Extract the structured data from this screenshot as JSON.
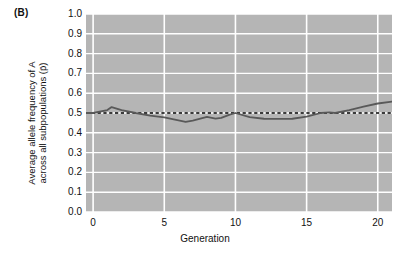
{
  "panel": {
    "label": "(B)"
  },
  "chart_data": {
    "type": "line",
    "title": "",
    "subtitle": "",
    "xlabel": "Generation",
    "ylabel_line1": "Average allele frequency of A",
    "ylabel_line2": "across all subpopulations (p̄)",
    "ylabel_symbol": "p-bar",
    "xlim": [
      -0.5,
      21.0
    ],
    "ylim": [
      0.0,
      1.0
    ],
    "xticks": [
      0,
      5,
      10,
      15,
      20
    ],
    "xtick_labels": [
      "0",
      "5",
      "10",
      "15",
      "20"
    ],
    "yticks": [
      0.0,
      0.1,
      0.2,
      0.3,
      0.4,
      0.5,
      0.6,
      0.7,
      0.8,
      0.9,
      1.0
    ],
    "ytick_labels": [
      "0.0",
      "0.1",
      "0.2",
      "0.3",
      "0.4",
      "0.5",
      "0.6",
      "0.7",
      "0.8",
      "0.9",
      "1.0"
    ],
    "grid": true,
    "grid_color": "#ffffff",
    "plot_background": "#b5b5b5",
    "legend": "none",
    "series": [
      {
        "name": "Average allele frequency",
        "type": "line",
        "color": "#595959",
        "linewidth": 1.8,
        "x": [
          -0.5,
          0,
          1,
          1.3,
          2,
          3,
          4,
          5,
          6,
          6.5,
          7,
          8,
          8.6,
          9,
          9.6,
          10,
          11,
          12,
          13,
          14,
          15,
          16,
          16.6,
          17,
          18,
          19,
          20,
          21
        ],
        "values": [
          0.5,
          0.5,
          0.515,
          0.53,
          0.515,
          0.5,
          0.487,
          0.478,
          0.463,
          0.455,
          0.462,
          0.48,
          0.472,
          0.475,
          0.492,
          0.5,
          0.479,
          0.471,
          0.47,
          0.471,
          0.482,
          0.5,
          0.503,
          0.5,
          0.515,
          0.532,
          0.548,
          0.558
        ]
      },
      {
        "name": "Expected (p = 0.5)",
        "type": "reference-line",
        "style": "dashed",
        "color": "#000000",
        "linewidth": 1.6,
        "y": 0.5
      }
    ],
    "annotations": []
  }
}
